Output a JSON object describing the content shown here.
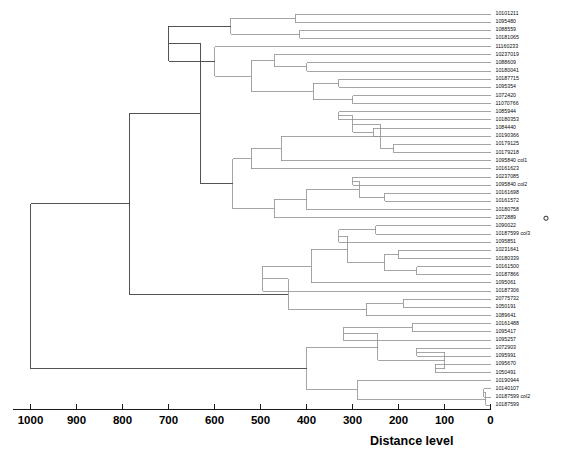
{
  "chart_data": {
    "type": "dendrogram",
    "title": "",
    "xlabel": "Distance level",
    "ylabel": "",
    "xlim": [
      1000,
      0
    ],
    "x_reversed": true,
    "grid": false,
    "legend": null,
    "tick_labels": [
      "1000",
      "900",
      "800",
      "700",
      "600",
      "500",
      "400",
      "300",
      "200",
      "100",
      "0"
    ],
    "tick_values": [
      1000,
      900,
      800,
      700,
      600,
      500,
      400,
      300,
      200,
      100,
      0
    ],
    "leaf_labels": [
      "10101211",
      "1095480",
      "1088559",
      "10181065",
      "11160233",
      "10237019",
      "1088609",
      "10180041",
      "10187715",
      "1095354",
      "1072420",
      "11070766",
      "1085944",
      "10180353",
      "1084440",
      "10190366",
      "10179125",
      "10179218",
      "1095840 col1",
      "10161623",
      "10237085",
      "1095840 col2",
      "10161698",
      "10161572",
      "10180758",
      "1072889",
      "1090022",
      "10187599 col3",
      "1095851",
      "10231641",
      "10180339",
      "10161500",
      "10187866",
      "1095061",
      "10187306",
      "20775732",
      "1050191",
      "1089641",
      "10161488",
      "1095417",
      "1095257",
      "1072903",
      "1095991",
      "1095670",
      "1050491",
      "10190944",
      "10140107",
      "10187599 col2",
      "10187599"
    ],
    "leaf_count": 49,
    "outlier_markers": [
      {
        "label": "1072889",
        "x_value": 0,
        "marker": "open-circle"
      }
    ],
    "merges": [
      {
        "id": "m1",
        "distance": 1000,
        "note": "root"
      },
      {
        "id": "m2",
        "distance": 785
      },
      {
        "id": "m3",
        "distance": 705
      },
      {
        "id": "m4",
        "distance": 630
      },
      {
        "id": "m5",
        "distance": 600
      },
      {
        "id": "m6",
        "distance": 575
      },
      {
        "id": "m7",
        "distance": 520
      },
      {
        "id": "m8",
        "distance": 490
      },
      {
        "id": "m9",
        "distance": 455
      },
      {
        "id": "m10",
        "distance": 420
      },
      {
        "id": "m11",
        "distance": 400
      },
      {
        "id": "m12",
        "distance": 375
      },
      {
        "id": "m13",
        "distance": 350
      },
      {
        "id": "m14",
        "distance": 320
      },
      {
        "id": "m15",
        "distance": 300
      },
      {
        "id": "m16",
        "distance": 270
      },
      {
        "id": "m17",
        "distance": 250
      },
      {
        "id": "m18",
        "distance": 230
      },
      {
        "id": "m19",
        "distance": 200
      },
      {
        "id": "m20",
        "distance": 150
      },
      {
        "id": "m21",
        "distance": 120
      },
      {
        "id": "m22",
        "distance": 90
      },
      {
        "id": "m23",
        "distance": 60
      },
      {
        "id": "m24",
        "distance": 30
      },
      {
        "id": "m25",
        "distance": 10
      }
    ]
  },
  "axis": {
    "title": "Distance level",
    "ticks": [
      "1000",
      "900",
      "800",
      "700",
      "600",
      "500",
      "400",
      "300",
      "200",
      "100",
      "0"
    ]
  },
  "colors": {
    "line": "#8f8f8f",
    "line_dark": "#4a4a4a",
    "axis": "#1a1a1a",
    "text": "#000000",
    "background": "#ffffff"
  }
}
